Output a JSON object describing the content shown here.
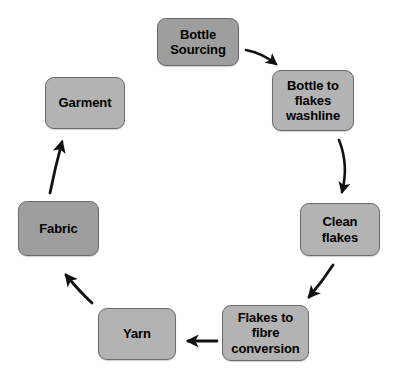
{
  "diagram": {
    "type": "circular-process-flow",
    "title": "",
    "background_color": "#ffffff",
    "arrow_color": "#111111",
    "node_border_color": "#6b6b6b",
    "node_fill_light": "#b3b3b3",
    "node_fill_dark": "#9e9e9e",
    "nodes": [
      {
        "id": "bottle-sourcing",
        "label": "Bottle\nSourcing",
        "shade": "dark"
      },
      {
        "id": "bottle-to-flakes",
        "label": "Bottle to\nflakes\nwashline",
        "shade": "light"
      },
      {
        "id": "clean-flakes",
        "label": "Clean\nflakes",
        "shade": "light"
      },
      {
        "id": "flakes-to-fibre",
        "label": "Flakes to\nfibre\nconversion",
        "shade": "light"
      },
      {
        "id": "yarn",
        "label": "Yarn",
        "shade": "light"
      },
      {
        "id": "fabric",
        "label": "Fabric",
        "shade": "dark"
      },
      {
        "id": "garment",
        "label": "Garment",
        "shade": "light"
      }
    ],
    "edges": [
      {
        "id": "edge-sourcing-to-washline",
        "from": "bottle-sourcing",
        "to": "bottle-to-flakes"
      },
      {
        "id": "edge-washline-to-clean",
        "from": "bottle-to-flakes",
        "to": "clean-flakes"
      },
      {
        "id": "edge-clean-to-fibre",
        "from": "clean-flakes",
        "to": "flakes-to-fibre"
      },
      {
        "id": "edge-fibre-to-yarn",
        "from": "flakes-to-fibre",
        "to": "yarn"
      },
      {
        "id": "edge-yarn-to-fabric",
        "from": "yarn",
        "to": "fabric"
      },
      {
        "id": "edge-fabric-to-garment",
        "from": "fabric",
        "to": "garment"
      }
    ]
  }
}
